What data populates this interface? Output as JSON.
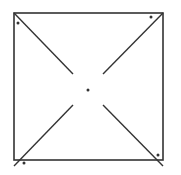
{
  "diagram": {
    "stroke_color": "#333333",
    "square": {
      "x": 14,
      "y": 13,
      "size": 149
    },
    "diagonal_segments": [
      {
        "name": "top-left",
        "x1": 14,
        "y1": 13,
        "x2": 73,
        "y2": 74
      },
      {
        "name": "top-right",
        "x1": 163,
        "y1": 13,
        "x2": 103,
        "y2": 74
      },
      {
        "name": "bottom-left",
        "x1": 14,
        "y1": 166,
        "x2": 73,
        "y2": 105
      },
      {
        "name": "bottom-right",
        "x1": 163,
        "y1": 166,
        "x2": 103,
        "y2": 105
      }
    ],
    "dots": [
      {
        "name": "center",
        "cx": 88,
        "cy": 90
      },
      {
        "name": "top-left",
        "cx": 18,
        "cy": 23
      },
      {
        "name": "top-right",
        "cx": 151,
        "cy": 17
      },
      {
        "name": "bottom-left",
        "cx": 24,
        "cy": 163
      },
      {
        "name": "bottom-right",
        "cx": 158,
        "cy": 155
      }
    ]
  }
}
